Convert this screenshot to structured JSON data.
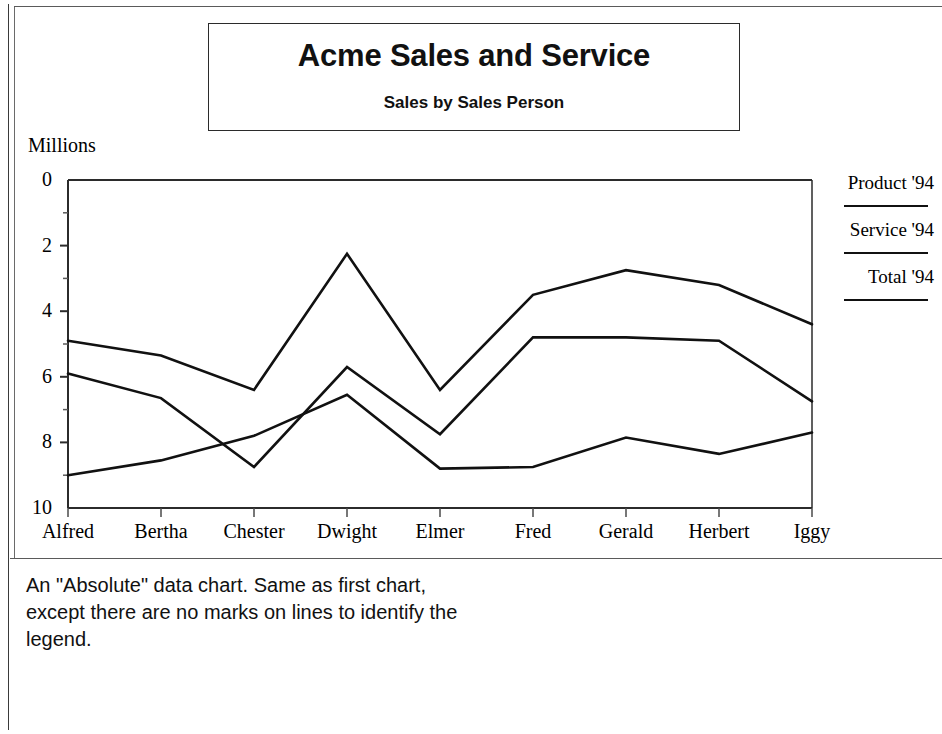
{
  "title_block": {
    "title": "Acme Sales and Service",
    "subtitle": "Sales by Sales Person"
  },
  "axis": {
    "unit_label": "Millions",
    "y_ticks": [
      "10",
      "8",
      "6",
      "4",
      "2",
      "0"
    ]
  },
  "legend": {
    "entries": [
      {
        "label": "Product '94"
      },
      {
        "label": "Service '94"
      },
      {
        "label": "Total '94"
      }
    ]
  },
  "caption": {
    "text": "An \"Absolute\" data chart.  Same as first chart,\nexcept there are no marks on lines to identify the\nlegend."
  },
  "chart_data": {
    "type": "line",
    "title": "Acme Sales and Service",
    "subtitle": "Sales by Sales Person",
    "xlabel": "",
    "ylabel": "Millions",
    "ylim": [
      0,
      10
    ],
    "ytick_values": [
      0,
      2,
      4,
      6,
      8,
      10
    ],
    "minor_ytick_values": [
      1,
      3,
      5,
      7,
      9
    ],
    "grid": false,
    "legend_position": "right",
    "line_color": "#111111",
    "markers": "none",
    "categories": [
      "Alfred",
      "Bertha",
      "Chester",
      "Dwight",
      "Elmer",
      "Fred",
      "Gerald",
      "Herbert",
      "Iggy"
    ],
    "series": [
      {
        "name": "Product '94",
        "values": [
          4.1,
          3.35,
          1.25,
          4.3,
          2.25,
          5.2,
          5.2,
          5.1,
          3.25
        ]
      },
      {
        "name": "Service '94",
        "values": [
          1.0,
          1.45,
          2.2,
          3.45,
          1.2,
          1.25,
          2.15,
          1.65,
          2.3
        ]
      },
      {
        "name": "Total '94",
        "values": [
          5.1,
          4.65,
          3.6,
          7.75,
          3.6,
          6.5,
          7.25,
          6.8,
          5.6
        ]
      }
    ]
  }
}
